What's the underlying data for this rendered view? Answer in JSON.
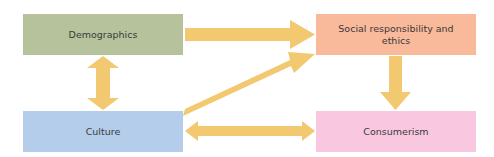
{
  "diagram": {
    "nodes": [
      {
        "id": "demographics",
        "label": "Demographics",
        "color": "#b6c29c"
      },
      {
        "id": "culture",
        "label": "Culture",
        "color": "#b4cdea"
      },
      {
        "id": "social",
        "label": "Social responsibility and ethics",
        "color": "#f9b99b"
      },
      {
        "id": "consumerism",
        "label": "Consumerism",
        "color": "#f9c7e0"
      }
    ],
    "edges": [
      {
        "from": "demographics",
        "to": "social",
        "direction": "one-way"
      },
      {
        "from": "culture",
        "to": "social",
        "direction": "one-way"
      },
      {
        "from": "demographics",
        "to": "culture",
        "direction": "two-way"
      },
      {
        "from": "culture",
        "to": "consumerism",
        "direction": "two-way"
      },
      {
        "from": "social",
        "to": "consumerism",
        "direction": "one-way"
      }
    ],
    "arrow_color": "#f2c870"
  }
}
